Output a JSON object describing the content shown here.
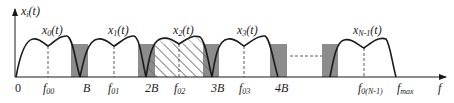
{
  "diagram": {
    "type": "frequency-spectrum",
    "y_axis_label": {
      "base": "x",
      "sub": "i",
      "arg": "(t)"
    },
    "x_axis_label": "f",
    "colors": {
      "curve": "#1a1a1a",
      "guard_band": "#8c8c8c",
      "hatch": "#333333",
      "axis": "#1a1a1a"
    },
    "ticks": [
      {
        "text": "0",
        "x": 18
      },
      {
        "base": "f",
        "sub": "00",
        "x": 48
      },
      {
        "text": "B",
        "x": 86
      },
      {
        "base": "f",
        "sub": "01",
        "x": 113
      },
      {
        "text": "2B",
        "x": 151
      },
      {
        "base": "f",
        "sub": "02",
        "x": 179
      },
      {
        "text": "3B",
        "x": 216
      },
      {
        "base": "f",
        "sub": "03",
        "x": 244
      },
      {
        "text": "4B",
        "x": 281
      },
      {
        "base": "f",
        "sub": "0(N-1)",
        "x": 362
      },
      {
        "base": "f",
        "sub": "max",
        "x": 398
      }
    ],
    "signals": [
      {
        "base": "x",
        "sub": "0",
        "arg": "(t)",
        "x": 48
      },
      {
        "base": "x",
        "sub": "1",
        "arg": "(t)",
        "x": 114
      },
      {
        "base": "x",
        "sub": "2",
        "arg": "(t)",
        "x": 178
      },
      {
        "base": "x",
        "sub": "3",
        "arg": "(t)",
        "x": 242
      },
      {
        "base": "x",
        "sub": "N-1",
        "arg": "(t)",
        "x": 357
      }
    ],
    "hatched_band": "x2(t)",
    "ellipsis": "dashed line between band 4B and last band"
  }
}
